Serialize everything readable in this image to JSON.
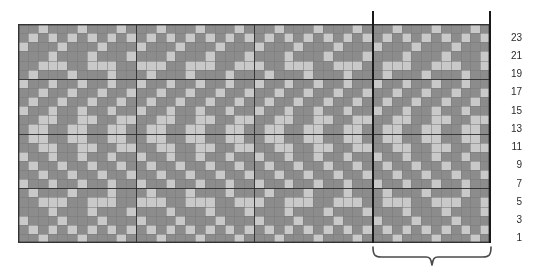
{
  "chart": {
    "type": "knitting-colorwork-grid",
    "columns": 48,
    "rows": 24,
    "cell_width_px": 9.83,
    "cell_height_px": 9.125,
    "colors": {
      "light": "#c9c9c9",
      "dark": "#8c8c8c",
      "gridline_minor": "#7a7a7a",
      "gridline_major": "#2a2a2a",
      "border": "#333333",
      "marker_line": "#1a1a1a",
      "brace": "#4a4a4a",
      "label_text": "#2b2b2b",
      "background": "#ffffff"
    },
    "legend": {
      "light_label": "main colour",
      "dark_label": "contrast colour"
    },
    "major_gridline_every_columns": 12,
    "major_gridline_every_rows": 6,
    "repeat": {
      "stitch_repeat": 12,
      "marker_left_column": 36,
      "marker_right_column": 48,
      "brace_label": ""
    },
    "row_numbers": [
      "23",
      "21",
      "19",
      "17",
      "15",
      "13",
      "11",
      "9",
      "7",
      "5",
      "3",
      "1"
    ],
    "row_number_side": "right",
    "row_number_rows": [
      23,
      21,
      19,
      17,
      15,
      13,
      11,
      9,
      7,
      5,
      3,
      1
    ],
    "pattern_note": "1 = dark contrast stitch, 0 = light main stitch; rows listed top (row 24) to bottom (row 1)",
    "pattern_rows_top_to_bottom": [
      "110111011101110111011101110111011101110111011101",
      "101010101010101010101010101010101010101010101010",
      "011101110111011101110111011101110111011101110111",
      "111011101110111011101110111011101110111011101110",
      "110001100011000110001100011000110001100011000110",
      "101110111011101110111011101110111011101110111011",
      "011011011011011011011011011011011011011011011011",
      "110110110110110110110110110110110110110110110110",
      "101101101101101101101101101101101101101101101101",
      "011011011011011011011011011011011011011011011011",
      "110011001100110011001100110011001100110011001100",
      "100110011001100110011001100110011001100110011001",
      "100110011001100110011001100110011001100110011001",
      "110011001100110011001100110011001100110011001100",
      "011011011011011011011011011011011011011011011011",
      "101101101101101101101101101101101101101101101101",
      "110110110110110110110110110110110110110110110110",
      "011011011011011011011011011011011011011011011011",
      "101110111011101110111011101110111011101110111011",
      "110001100011000110001100011000110001100011000110",
      "111011101110111011101110111011101110111011101110",
      "011101110111011101110111011101110111011101110111",
      "101010101010101010101010101010101010101010101010",
      "110111011101110111011101110111011101110111011101"
    ]
  }
}
